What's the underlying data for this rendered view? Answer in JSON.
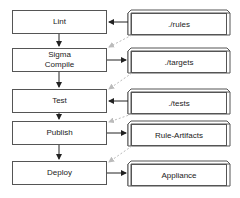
{
  "diagram": {
    "type": "pipeline-flow",
    "steps": [
      {
        "label": "Lint"
      },
      {
        "label": "Sigma\nCompile"
      },
      {
        "label": "Test"
      },
      {
        "label": "Publish"
      },
      {
        "label": "Deploy"
      }
    ],
    "resources": [
      {
        "label": "./rules"
      },
      {
        "label": "./targets"
      },
      {
        "label": "./tests"
      },
      {
        "label": "Rule-Artifacts"
      },
      {
        "label": "Appliance"
      }
    ],
    "edges": [
      {
        "from": "Lint",
        "to": "Sigma Compile",
        "style": "solid"
      },
      {
        "from": "Sigma Compile",
        "to": "Test",
        "style": "solid"
      },
      {
        "from": "Test",
        "to": "Publish",
        "style": "solid"
      },
      {
        "from": "Publish",
        "to": "Deploy",
        "style": "solid"
      },
      {
        "from": "./rules",
        "to": "Lint",
        "style": "solid"
      },
      {
        "from": "Sigma Compile",
        "to": "./targets",
        "style": "solid"
      },
      {
        "from": "./tests",
        "to": "Test",
        "style": "solid"
      },
      {
        "from": "Publish",
        "to": "Rule-Artifacts",
        "style": "solid"
      },
      {
        "from": "Deploy",
        "to": "Appliance",
        "style": "solid"
      },
      {
        "from": "./rules",
        "to": "Sigma Compile",
        "style": "dashed"
      },
      {
        "from": "./targets",
        "to": "Test",
        "style": "dashed"
      },
      {
        "from": "./tests",
        "to": "Publish",
        "style": "dashed"
      },
      {
        "from": "Rule-Artifacts",
        "to": "Deploy",
        "style": "dashed"
      }
    ],
    "colors": {
      "line": "#222222",
      "dashed": "#bbbbbb",
      "border": "#555555"
    }
  }
}
